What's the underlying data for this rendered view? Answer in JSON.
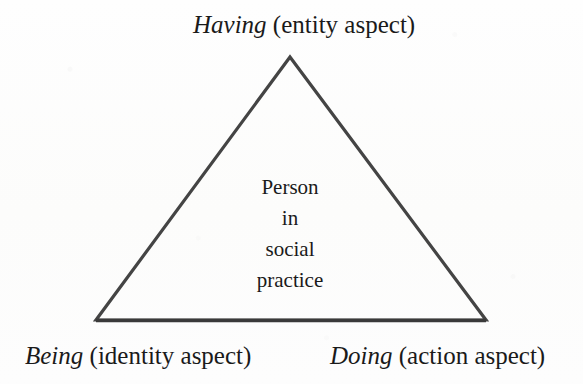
{
  "figure": {
    "type": "triangle-diagram",
    "background_color": "#fdfdfc",
    "stroke_color": "#444444",
    "text_color": "#1a1a1a"
  },
  "vertices": {
    "top": {
      "term": "Having",
      "gloss": " (entity aspect)",
      "term_style": "italic",
      "gloss_style": "roman"
    },
    "bottom_left": {
      "term": "Being",
      "gloss": " (identity aspect)",
      "term_style": "italic",
      "gloss_style": "roman"
    },
    "bottom_right": {
      "term": "Doing",
      "gloss": " (action aspect)",
      "term_style": "italic",
      "gloss_style": "roman"
    }
  },
  "center": {
    "lines": [
      "Person",
      "in",
      "social",
      "practice"
    ]
  }
}
